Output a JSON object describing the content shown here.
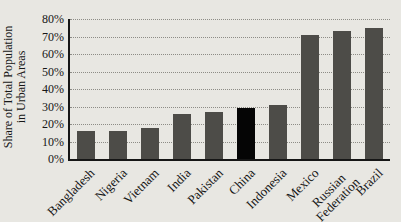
{
  "chart_data": {
    "type": "bar",
    "title": "",
    "ylabel": "Share of Total Population in Urban Areas",
    "ylabel_line1": "Share of Total Population",
    "ylabel_line2": "in Urban Areas",
    "categories": [
      "Bangladesh",
      "Nigeria",
      "Vietnam",
      "India",
      "Pakistan",
      "China",
      "Indonesia",
      "Mexico",
      "Russian\nFederation",
      "Brazil"
    ],
    "values": [
      16,
      16,
      18,
      26,
      27,
      29,
      31,
      71,
      73,
      75
    ],
    "highlight_category": "China",
    "y_ticks": [
      "0%",
      "10%",
      "20%",
      "30%",
      "40%",
      "50%",
      "60%",
      "70%",
      "80%"
    ],
    "ylim": [
      0,
      80
    ],
    "grid": "horizontal-dotted",
    "legend": "none",
    "colors": {
      "bar": "#4d4c48",
      "highlight_bar": "#050505",
      "background": "#e8e7e2",
      "gridline": "#8d8c86",
      "axis": "#161616",
      "text": "#161616"
    }
  }
}
